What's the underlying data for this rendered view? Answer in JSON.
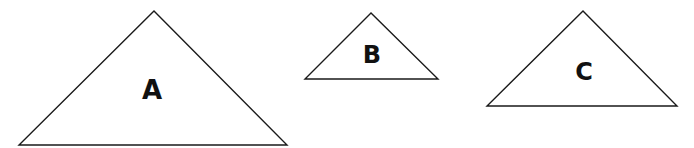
{
  "diagram": {
    "background": "#ffffff",
    "stroke_color": "#1a1a1a",
    "triangles": [
      {
        "label": "A",
        "points": [
          [
            154,
            11
          ],
          [
            19,
            145
          ],
          [
            287,
            145
          ]
        ],
        "label_pos": [
          152,
          90
        ],
        "label_size": 26
      },
      {
        "label": "B",
        "points": [
          [
            371,
            13
          ],
          [
            305,
            79
          ],
          [
            438,
            79
          ]
        ],
        "label_pos": [
          372,
          55
        ],
        "label_size": 24
      },
      {
        "label": "C",
        "points": [
          [
            583,
            11
          ],
          [
            487,
            106
          ],
          [
            677,
            106
          ]
        ],
        "label_pos": [
          584,
          72
        ],
        "label_size": 24
      }
    ]
  }
}
